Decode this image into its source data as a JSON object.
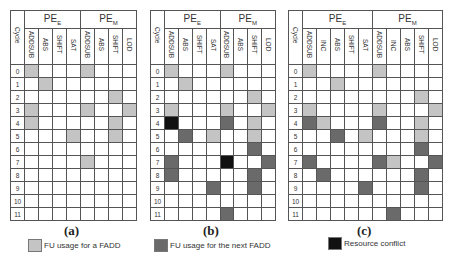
{
  "colors": {
    "light": "#c4c4c4",
    "dark": "#6a6a6a",
    "conflict": "#111111"
  },
  "tables": [
    {
      "id": "a",
      "caption": "(a)",
      "cycle_label": "Cycle",
      "groups": [
        {
          "label": "PE",
          "sub": "E",
          "columns": [
            "ADDSUB",
            "ABS",
            "SHIFT",
            "SAT"
          ]
        },
        {
          "label": "PE",
          "sub": "M",
          "columns": [
            "ADDSUB",
            "ABS",
            "SHIFT",
            "LOD"
          ]
        }
      ],
      "cycles": [
        "0",
        "1",
        "2",
        "3",
        "4",
        "5",
        "6",
        "7",
        "8",
        "9",
        "10",
        "11"
      ],
      "grid": [
        [
          "L",
          "",
          "",
          "",
          "L",
          "",
          "",
          ""
        ],
        [
          "",
          "L",
          "",
          "",
          "",
          "",
          "",
          ""
        ],
        [
          "",
          "",
          "",
          "",
          "",
          "",
          "L",
          ""
        ],
        [
          "L",
          "",
          "",
          "",
          "L",
          "",
          "",
          "L"
        ],
        [
          "L",
          "",
          "",
          "",
          "",
          "",
          "L",
          ""
        ],
        [
          "",
          "",
          "",
          "L",
          "",
          "",
          "L",
          ""
        ],
        [
          "",
          "",
          "",
          "",
          "",
          "",
          "",
          ""
        ],
        [
          "",
          "",
          "",
          "",
          "L",
          "",
          "",
          ""
        ],
        [
          "",
          "",
          "",
          "",
          "",
          "",
          "",
          ""
        ],
        [
          "",
          "",
          "",
          "",
          "",
          "",
          "",
          ""
        ],
        [
          "",
          "",
          "",
          "",
          "",
          "",
          "",
          ""
        ],
        [
          "",
          "",
          "",
          "",
          "",
          "",
          "",
          ""
        ]
      ]
    },
    {
      "id": "b",
      "caption": "(b)",
      "cycle_label": "Cycle",
      "groups": [
        {
          "label": "PE",
          "sub": "E",
          "columns": [
            "ADDSUB",
            "ABS",
            "SHIFT",
            "SAT"
          ]
        },
        {
          "label": "PE",
          "sub": "M",
          "columns": [
            "ADDSUB",
            "ABS",
            "SHIFT",
            "LOD"
          ]
        }
      ],
      "cycles": [
        "0",
        "1",
        "2",
        "3",
        "4",
        "5",
        "6",
        "7",
        "8",
        "9",
        "10",
        "11"
      ],
      "grid": [
        [
          "L",
          "",
          "",
          "",
          "L",
          "",
          "",
          ""
        ],
        [
          "",
          "L",
          "",
          "",
          "",
          "",
          "",
          ""
        ],
        [
          "",
          "",
          "",
          "",
          "",
          "",
          "L",
          ""
        ],
        [
          "L",
          "",
          "",
          "",
          "L",
          "",
          "",
          "L"
        ],
        [
          "X",
          "",
          "",
          "",
          "D",
          "",
          "L",
          ""
        ],
        [
          "",
          "D",
          "",
          "L",
          "",
          "",
          "L",
          ""
        ],
        [
          "",
          "",
          "",
          "",
          "",
          "",
          "D",
          ""
        ],
        [
          "D",
          "",
          "",
          "",
          "X",
          "",
          "",
          "D"
        ],
        [
          "D",
          "",
          "",
          "",
          "",
          "",
          "D",
          ""
        ],
        [
          "",
          "",
          "",
          "D",
          "",
          "",
          "D",
          ""
        ],
        [
          "",
          "",
          "",
          "",
          "",
          "",
          "",
          ""
        ],
        [
          "",
          "",
          "",
          "",
          "D",
          "",
          "",
          ""
        ]
      ]
    },
    {
      "id": "c",
      "caption": "(c)",
      "cycle_label": "Cycle",
      "groups": [
        {
          "label": "PE",
          "sub": "E",
          "columns": [
            "ADDSUB",
            "INC",
            "ABS",
            "SHIFT",
            "SAT"
          ]
        },
        {
          "label": "PE",
          "sub": "M",
          "columns": [
            "ADDSUB",
            "INC",
            "ABS",
            "SHIFT",
            "LOD"
          ]
        }
      ],
      "cycles": [
        "0",
        "1",
        "2",
        "3",
        "4",
        "5",
        "6",
        "7",
        "8",
        "9",
        "10",
        "11"
      ],
      "grid": [
        [
          "L",
          "",
          "",
          "",
          "",
          "L",
          "",
          "",
          "",
          ""
        ],
        [
          "",
          "",
          "L",
          "",
          "",
          "",
          "",
          "",
          "",
          ""
        ],
        [
          "",
          "",
          "",
          "",
          "",
          "",
          "",
          "",
          "L",
          ""
        ],
        [
          "L",
          "",
          "",
          "",
          "",
          "L",
          "",
          "",
          "",
          "L"
        ],
        [
          "D",
          "L",
          "",
          "",
          "",
          "D",
          "",
          "",
          "L",
          ""
        ],
        [
          "",
          "",
          "D",
          "",
          "L",
          "",
          "",
          "",
          "L",
          ""
        ],
        [
          "",
          "",
          "",
          "",
          "",
          "",
          "",
          "",
          "D",
          ""
        ],
        [
          "D",
          "",
          "",
          "",
          "",
          "D",
          "L",
          "",
          "",
          "D"
        ],
        [
          "",
          "D",
          "",
          "",
          "",
          "",
          "",
          "",
          "D",
          ""
        ],
        [
          "",
          "",
          "",
          "",
          "D",
          "",
          "",
          "",
          "D",
          ""
        ],
        [
          "",
          "",
          "",
          "",
          "",
          "",
          "",
          "",
          "",
          ""
        ],
        [
          "",
          "",
          "",
          "",
          "",
          "",
          "D",
          "",
          "",
          ""
        ]
      ]
    }
  ],
  "legend": [
    {
      "key": "L",
      "label": "FU usage for a FADD",
      "color": "#c4c4c4"
    },
    {
      "key": "D",
      "label": "FU usage for the next FADD",
      "color": "#6a6a6a"
    },
    {
      "key": "X",
      "label": "Resource conflict",
      "color": "#111111"
    }
  ]
}
